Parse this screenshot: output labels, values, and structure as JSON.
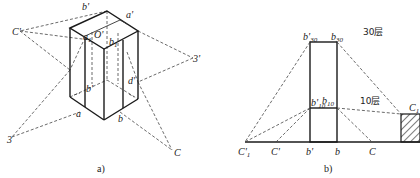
{
  "figure_a": {
    "caption": "a)",
    "labels": {
      "b_prime_top": "b'",
      "a_prime": "a'",
      "a1": "a",
      "a1_sub": "1",
      "O_prime": "O'",
      "b1": "b",
      "b1_sub": "1",
      "C_prime": "C'",
      "three_prime": "3'",
      "d_prime": "d'",
      "b_prime_mid": "b'",
      "a": "a",
      "b": "b",
      "three": "3",
      "C": "C"
    }
  },
  "figure_b": {
    "caption": "b)",
    "labels": {
      "b30_prime": "b'",
      "b30_prime_sub": "30",
      "b30": "b",
      "b30_sub": "30",
      "floors_30": "30层",
      "b10_prime": "b'",
      "b10_prime_sub": "10",
      "b10": "b",
      "b10_sub": "10",
      "floors_10": "10层",
      "C1": "C",
      "C1_sub": "1",
      "C1_prime": "C'",
      "C1_prime_sub": "1",
      "C_prime": "C'",
      "b_prime": "b'",
      "b": "b",
      "C": "C"
    }
  }
}
